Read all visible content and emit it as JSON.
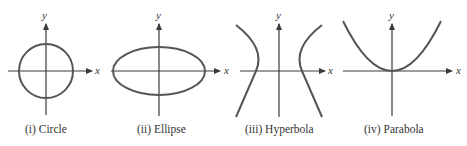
{
  "figure": {
    "panels": [
      {
        "id": "circle",
        "caption": "(i)  Circle",
        "x_label": "x",
        "y_label": "y",
        "shape": "circle"
      },
      {
        "id": "ellipse",
        "caption": "(ii)  Ellipse",
        "x_label": "x",
        "y_label": "y",
        "shape": "ellipse"
      },
      {
        "id": "hyperbola",
        "caption": "(iii)  Hyperbola",
        "x_label": "x",
        "y_label": "y",
        "shape": "hyperbola"
      },
      {
        "id": "parabola",
        "caption": "(iv)  Parabola",
        "x_label": "x",
        "y_label": "y",
        "shape": "parabola"
      }
    ],
    "colors": {
      "axis": "#3a3a3a",
      "curve": "#555555",
      "text": "#333333"
    }
  }
}
